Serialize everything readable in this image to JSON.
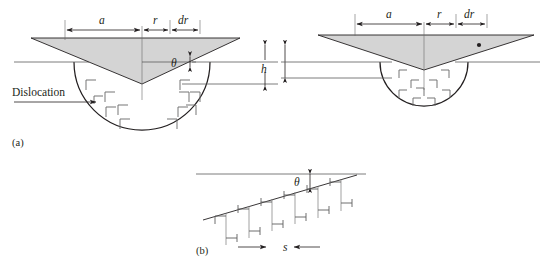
{
  "figure": {
    "background_color": "#ffffff",
    "wedge_fill_color": "#d4d4d4",
    "line_color": "#231f20",
    "dislocation_color": "#6f6f6f"
  },
  "panels": [
    {
      "id": "a",
      "label": "(a)",
      "description": "Two indentation wedges with plastic zone hemispheres containing edge dislocations"
    },
    {
      "id": "b",
      "label": "(b)",
      "description": "Inclined surface with array of edge dislocations spaced by s"
    }
  ],
  "labels": {
    "dislocation": "Dislocation",
    "panel_a": "(a)",
    "panel_b": "(b)",
    "a_left": "a",
    "r_left": "r",
    "dr_left": "dr",
    "theta_left": "θ",
    "h": "h",
    "a_right": "a",
    "r_right": "r",
    "dr_right": "dr",
    "theta_b": "θ",
    "s": "s"
  },
  "dimensions": {
    "a": {
      "symbol": "a",
      "meaning": "indent contact half-width"
    },
    "r": {
      "symbol": "r",
      "meaning": "radial coordinate increment start"
    },
    "dr": {
      "symbol": "dr",
      "meaning": "differential radial element"
    },
    "h": {
      "symbol": "h",
      "meaning": "indentation depth"
    },
    "theta": {
      "symbol": "θ",
      "meaning": "wedge half-angle / surface inclination"
    },
    "s": {
      "symbol": "s",
      "meaning": "dislocation spacing"
    }
  },
  "geometry": {
    "left_diagram": {
      "wedge_apex": [
        142,
        77
      ],
      "wedge_top_left": [
        31,
        38
      ],
      "wedge_top_right": [
        240,
        38
      ],
      "hemisphere_center": [
        142,
        62
      ],
      "hemisphere_radius": 68,
      "dislocation_count": 11
    },
    "right_diagram": {
      "wedge_apex": [
        424,
        70
      ],
      "wedge_top_left": [
        318,
        35
      ],
      "wedge_top_right": [
        534,
        35
      ],
      "hemisphere_center": [
        424,
        62
      ],
      "hemisphere_radius": 44,
      "dislocation_count": 9,
      "marker_dot": [
        479,
        45
      ]
    },
    "bottom_diagram": {
      "slope_start": [
        203,
        220
      ],
      "slope_end": [
        355,
        175
      ],
      "dislocation_count": 12
    }
  }
}
